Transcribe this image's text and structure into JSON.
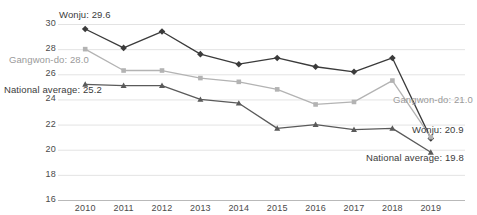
{
  "chart_data": {
    "type": "line",
    "title": "",
    "subtitle": "",
    "xlabel": "",
    "ylabel": "",
    "categories": [
      "2010",
      "2011",
      "2012",
      "2013",
      "2014",
      "2015",
      "2016",
      "2017",
      "2018",
      "2019"
    ],
    "ylim": [
      16,
      30
    ],
    "yticks": [
      16,
      18,
      20,
      22,
      24,
      26,
      28,
      30
    ],
    "grid": true,
    "legend_position": "none",
    "series": [
      {
        "name": "Wonju",
        "color": "#3b3b3b",
        "marker": "diamond",
        "values": [
          29.6,
          28.1,
          29.4,
          27.6,
          26.8,
          27.3,
          26.6,
          26.2,
          27.3,
          20.9
        ]
      },
      {
        "name": "Gangwon-do",
        "color": "#b3b3b3",
        "marker": "square",
        "values": [
          28.0,
          26.3,
          26.3,
          25.7,
          25.4,
          24.8,
          23.6,
          23.8,
          25.5,
          21.0
        ]
      },
      {
        "name": "National average",
        "color": "#5a5a5a",
        "marker": "triangle",
        "values": [
          25.2,
          25.1,
          25.1,
          24.0,
          23.7,
          21.7,
          22.0,
          21.6,
          21.7,
          19.8
        ]
      }
    ],
    "annotations": [
      {
        "id": "wonju-start",
        "text": "Wonju: 29.6",
        "tone": "dark",
        "x": 59,
        "y": 9
      },
      {
        "id": "gangwon-start",
        "text": "Gangwon-do: 28.0",
        "tone": "grey",
        "x": 9,
        "y": 54
      },
      {
        "id": "national-start",
        "text": "National average: 25.2",
        "tone": "dark",
        "x": 4,
        "y": 84
      },
      {
        "id": "gangwon-end",
        "text": "Gangwon-do: 21.0",
        "tone": "grey",
        "x": 393,
        "y": 94
      },
      {
        "id": "wonju-end",
        "text": "Wonju: 20.9",
        "tone": "dark",
        "x": 412,
        "y": 124
      },
      {
        "id": "national-end",
        "text": "National average: 19.8",
        "tone": "dark",
        "x": 366,
        "y": 152
      }
    ],
    "colors": {
      "grid": "#e3e3e3",
      "axis": "#b9b9b9",
      "text": "#4a4a4a",
      "wonju": "#3b3b3b",
      "gangwon": "#b3b3b3",
      "national": "#5a5a5a"
    }
  }
}
